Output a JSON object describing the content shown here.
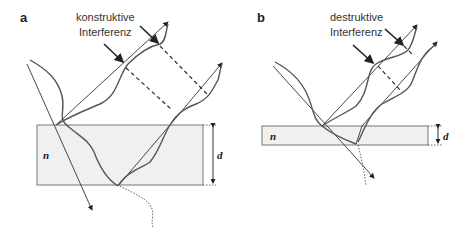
{
  "panels": [
    {
      "id": "a",
      "label": "a",
      "annotation_line1": "konstruktive",
      "annotation_line2": "Interferenz",
      "medium_symbol": "n",
      "thickness_symbol": "d",
      "colors": {
        "slab_fill": "#f0f0f0",
        "slab_stroke": "#777777",
        "line": "#333333"
      }
    },
    {
      "id": "b",
      "label": "b",
      "annotation_line1": "destruktive",
      "annotation_line2": "Interferenz",
      "medium_symbol": "n",
      "thickness_symbol": "d",
      "colors": {
        "slab_fill": "#f0f0f0",
        "slab_stroke": "#777777",
        "line": "#333333"
      }
    }
  ]
}
